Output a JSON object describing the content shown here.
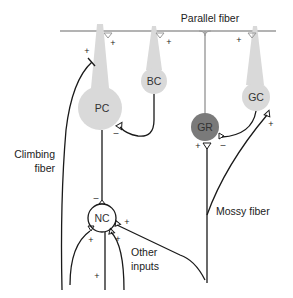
{
  "diagram": {
    "title": "Parallel fiber",
    "colors": {
      "parallel_fiber": "#9a9a9a",
      "cell_light": "#d9d9d9",
      "cell_dark": "#7a7a7a",
      "line": "#1a1a1a"
    },
    "cells": {
      "pc": "PC",
      "bc": "BC",
      "gr": "GR",
      "gc": "GC",
      "nc": "NC"
    },
    "labels": {
      "climbing_fiber_line1": "Climbing",
      "climbing_fiber_line2": "fiber",
      "mossy_fiber": "Mossy fiber",
      "other_inputs_line1": "Other",
      "other_inputs_line2": "inputs"
    },
    "signs": {
      "plus": "+",
      "minus": "–"
    }
  }
}
